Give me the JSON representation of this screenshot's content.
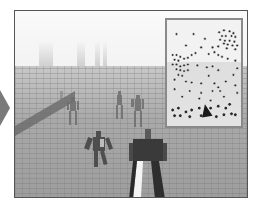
{
  "scene": {
    "type": "third-person 3D crowd simulation view",
    "palette": {
      "sky": "#f5f5f5",
      "floor": "#a8a8a8",
      "frame": "#555555",
      "minimap_border": "#8a8a8a",
      "agent_dot": "#2a2a2a",
      "player_marker": "#1a1a1a"
    }
  },
  "side_nav": {
    "icon": "chevron-right-icon"
  },
  "minimap": {
    "label": "overhead-minimap",
    "dots_small": [
      [
        10,
        12
      ],
      [
        28,
        12
      ],
      [
        40,
        17
      ],
      [
        20,
        24
      ],
      [
        36,
        26
      ],
      [
        48,
        26
      ],
      [
        55,
        10
      ],
      [
        60,
        8
      ],
      [
        66,
        9
      ],
      [
        70,
        11
      ],
      [
        58,
        14
      ],
      [
        62,
        14
      ],
      [
        68,
        14
      ],
      [
        72,
        15
      ],
      [
        56,
        18
      ],
      [
        61,
        19
      ],
      [
        66,
        19
      ],
      [
        71,
        20
      ],
      [
        60,
        22
      ],
      [
        64,
        23
      ],
      [
        69,
        24
      ],
      [
        74,
        24
      ],
      [
        63,
        27
      ],
      [
        72,
        28
      ],
      [
        54,
        25
      ],
      [
        6,
        34
      ],
      [
        10,
        34
      ],
      [
        14,
        36
      ],
      [
        8,
        39
      ],
      [
        12,
        40
      ],
      [
        18,
        38
      ],
      [
        22,
        37
      ],
      [
        26,
        34
      ],
      [
        6,
        44
      ],
      [
        10,
        44
      ],
      [
        14,
        46
      ],
      [
        18,
        45
      ],
      [
        22,
        44
      ],
      [
        10,
        49
      ],
      [
        14,
        50
      ],
      [
        18,
        51
      ],
      [
        22,
        50
      ],
      [
        12,
        55
      ],
      [
        16,
        56
      ],
      [
        30,
        32
      ],
      [
        44,
        33
      ],
      [
        50,
        31
      ],
      [
        54,
        34
      ],
      [
        58,
        36
      ],
      [
        32,
        45
      ],
      [
        42,
        47
      ],
      [
        48,
        46
      ],
      [
        54,
        50
      ],
      [
        64,
        38
      ],
      [
        72,
        40
      ],
      [
        74,
        48
      ],
      [
        70,
        55
      ],
      [
        44,
        56
      ],
      [
        8,
        60
      ],
      [
        20,
        62
      ],
      [
        26,
        63
      ],
      [
        36,
        64
      ],
      [
        50,
        64
      ],
      [
        54,
        68
      ],
      [
        62,
        62
      ],
      [
        24,
        72
      ],
      [
        36,
        74
      ],
      [
        48,
        72
      ],
      [
        56,
        72
      ],
      [
        16,
        78
      ],
      [
        34,
        80
      ],
      [
        46,
        82
      ],
      [
        60,
        78
      ],
      [
        72,
        66
      ],
      [
        74,
        74
      ],
      [
        8,
        70
      ]
    ],
    "dots_large": [
      [
        6,
        92
      ],
      [
        12,
        90
      ],
      [
        20,
        94
      ],
      [
        26,
        92
      ],
      [
        34,
        90
      ],
      [
        46,
        90
      ],
      [
        54,
        88
      ],
      [
        62,
        90
      ],
      [
        8,
        98
      ],
      [
        14,
        98
      ],
      [
        24,
        99
      ],
      [
        36,
        98
      ],
      [
        52,
        99
      ],
      [
        60,
        97
      ],
      [
        68,
        96
      ],
      [
        72,
        97
      ],
      [
        66,
        86
      ]
    ],
    "player_marker": {
      "x": 40,
      "y": 92,
      "heading_deg": 20
    }
  },
  "characters": [
    {
      "role": "player",
      "x": 128,
      "y": 128,
      "scale": 1.0
    },
    {
      "role": "npc",
      "x": 84,
      "y": 128,
      "scale": 0.75
    },
    {
      "role": "npc",
      "x": 58,
      "y": 88,
      "scale": 0.6
    },
    {
      "role": "npc",
      "x": 104,
      "y": 82,
      "scale": 0.55
    },
    {
      "role": "npc",
      "x": 122,
      "y": 86,
      "scale": 0.6
    },
    {
      "role": "npc",
      "x": 45,
      "y": 80,
      "scale": 0.4
    }
  ]
}
